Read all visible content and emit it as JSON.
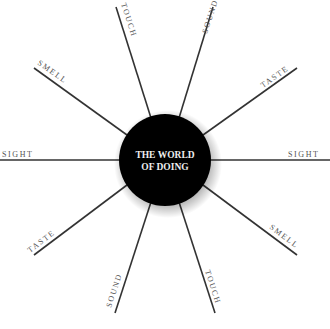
{
  "center": {
    "line1": "THE WORLD",
    "line2": "OF DOING"
  },
  "spokes": [
    {
      "label": "TOUCH",
      "x1": 151,
      "y1": 118,
      "x2": 116,
      "y2": 7,
      "tx": 121,
      "ty": 4,
      "rot": 72
    },
    {
      "label": "SOUND",
      "x1": 179,
      "y1": 118,
      "x2": 213,
      "y2": 7,
      "tx": 207,
      "ty": 34,
      "rot": -72
    },
    {
      "label": "TASTE",
      "x1": 203,
      "y1": 135,
      "x2": 297,
      "y2": 68,
      "tx": 263,
      "ty": 88,
      "rot": -35
    },
    {
      "label": "SIGHT",
      "x1": 210,
      "y1": 160,
      "x2": 330,
      "y2": 160,
      "tx": 288,
      "ty": 157,
      "rot": 0
    },
    {
      "label": "SMELL",
      "x1": 203,
      "y1": 185,
      "x2": 297,
      "y2": 255,
      "tx": 269,
      "ty": 228,
      "rot": 37
    },
    {
      "label": "TOUCH",
      "x1": 179,
      "y1": 202,
      "x2": 215,
      "y2": 313,
      "tx": 205,
      "ty": 271,
      "rot": 72
    },
    {
      "label": "SOUND",
      "x1": 151,
      "y1": 202,
      "x2": 115,
      "y2": 313,
      "tx": 111,
      "ty": 308,
      "rot": -72
    },
    {
      "label": "TASTE",
      "x1": 127,
      "y1": 185,
      "x2": 34,
      "y2": 255,
      "tx": 30,
      "ty": 253,
      "rot": -37
    },
    {
      "label": "SIGHT",
      "x1": 120,
      "y1": 160,
      "x2": 0,
      "y2": 160,
      "tx": 2,
      "ty": 157,
      "rot": 0
    },
    {
      "label": "SMELL",
      "x1": 127,
      "y1": 135,
      "x2": 34,
      "y2": 68,
      "tx": 37,
      "ty": 64,
      "rot": 35
    }
  ]
}
